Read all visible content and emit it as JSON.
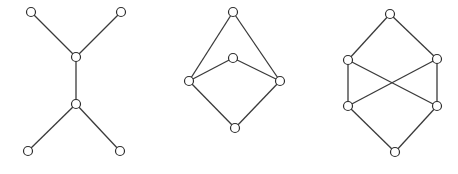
{
  "diagram": {
    "width": 458,
    "height": 174,
    "background": "#ffffff",
    "edge_color": "#3a3a3a",
    "node_stroke": "#2e2e2e",
    "node_fill": "#ffffff",
    "node_radius": 4.5,
    "graphs": [
      {
        "name": "tree-graph",
        "nodes": [
          {
            "id": "a",
            "x": 31,
            "y": 12
          },
          {
            "id": "b",
            "x": 121,
            "y": 12
          },
          {
            "id": "c",
            "x": 76,
            "y": 57
          },
          {
            "id": "d",
            "x": 76,
            "y": 104
          },
          {
            "id": "e",
            "x": 28,
            "y": 151
          },
          {
            "id": "f",
            "x": 120,
            "y": 151
          }
        ],
        "edges": [
          [
            "a",
            "c"
          ],
          [
            "b",
            "c"
          ],
          [
            "c",
            "d"
          ],
          [
            "d",
            "e"
          ],
          [
            "d",
            "f"
          ]
        ]
      },
      {
        "name": "pentagon-lattice-graph",
        "nodes": [
          {
            "id": "top",
            "x": 233,
            "y": 12
          },
          {
            "id": "mid",
            "x": 233,
            "y": 58
          },
          {
            "id": "left",
            "x": 189,
            "y": 81
          },
          {
            "id": "right",
            "x": 280,
            "y": 81
          },
          {
            "id": "bottom",
            "x": 235,
            "y": 128
          }
        ],
        "edges": [
          [
            "top",
            "left"
          ],
          [
            "top",
            "right"
          ],
          [
            "mid",
            "left"
          ],
          [
            "mid",
            "right"
          ],
          [
            "left",
            "bottom"
          ],
          [
            "right",
            "bottom"
          ]
        ]
      },
      {
        "name": "crossed-hexagon-graph",
        "nodes": [
          {
            "id": "top",
            "x": 390,
            "y": 14
          },
          {
            "id": "ul",
            "x": 348,
            "y": 60
          },
          {
            "id": "ur",
            "x": 437,
            "y": 59
          },
          {
            "id": "ll",
            "x": 348,
            "y": 106
          },
          {
            "id": "lr",
            "x": 437,
            "y": 106
          },
          {
            "id": "bottom",
            "x": 395,
            "y": 152
          }
        ],
        "edges": [
          [
            "top",
            "ul"
          ],
          [
            "top",
            "ur"
          ],
          [
            "ul",
            "ll"
          ],
          [
            "ur",
            "lr"
          ],
          [
            "ul",
            "lr"
          ],
          [
            "ur",
            "ll"
          ],
          [
            "ll",
            "bottom"
          ],
          [
            "lr",
            "bottom"
          ]
        ]
      }
    ]
  }
}
